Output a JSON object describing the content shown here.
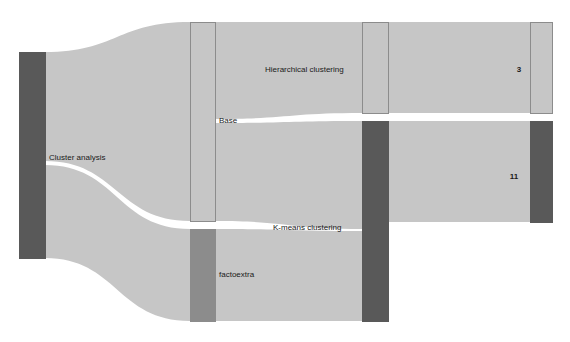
{
  "chart_data": {
    "type": "sankey",
    "title": "",
    "background_color": "#ffffff",
    "link_color": "#c6c6c6",
    "link_opacity": 1,
    "nodes": [
      {
        "id": "cluster-analysis",
        "label": "Cluster analysis",
        "value": 14,
        "column": 0,
        "x": 19,
        "y": 52,
        "width": 26,
        "height": 206,
        "color": "#595959",
        "stroke": "#595959",
        "label_x": 49,
        "label_y": 158,
        "label_anchor": "start"
      },
      {
        "id": "base",
        "label": "Base",
        "value": 9,
        "column": 1,
        "x": 190,
        "y": 22,
        "width": 25,
        "height": 199,
        "color": "#c6c6c6",
        "stroke": "#8c8c8c",
        "label_x": 219,
        "label_y": 121,
        "label_anchor": "start"
      },
      {
        "id": "factoextra",
        "label": "factoextra",
        "value": 5,
        "column": 1,
        "x": 190,
        "y": 229,
        "width": 25,
        "height": 92,
        "color": "#8c8c8c",
        "stroke": "#8c8c8c",
        "label_x": 219,
        "label_y": 275,
        "label_anchor": "start"
      },
      {
        "id": "hierarchical-clustering",
        "label": "Hierarchical clustering",
        "value": 3,
        "column": 2,
        "x": 362,
        "y": 22,
        "width": 26,
        "height": 91,
        "color": "#c6c6c6",
        "stroke": "#8c8c8c",
        "label_x": 265,
        "label_y": 70,
        "label_anchor": "start"
      },
      {
        "id": "k-means-clustering",
        "label": "K-means clustering",
        "value": 11,
        "column": 2,
        "x": 362,
        "y": 121,
        "width": 26,
        "height": 200,
        "color": "#595959",
        "stroke": "#595959",
        "label_x": 273,
        "label_y": 228,
        "label_anchor": "start"
      },
      {
        "id": "out-3",
        "label": "3",
        "value": 3,
        "column": 3,
        "x": 530,
        "y": 22,
        "width": 22,
        "height": 91,
        "color": "#c6c6c6",
        "stroke": "#8c8c8c",
        "label_x": 519,
        "label_y": 70,
        "label_anchor": "middle"
      },
      {
        "id": "out-11",
        "label": "11",
        "value": 11,
        "column": 3,
        "x": 530,
        "y": 121,
        "width": 22,
        "height": 101,
        "color": "#595959",
        "stroke": "#595959",
        "label_x": 514,
        "label_y": 177,
        "label_anchor": "middle"
      }
    ],
    "links": [
      {
        "id": "link-cluster-base",
        "source": "cluster-analysis",
        "target": "base",
        "value": 9,
        "path": "M45,52 C117,52 117,22 190,22 L190,221 C117,221 117,161 45,161 Z"
      },
      {
        "id": "link-cluster-factoextra",
        "source": "cluster-analysis",
        "target": "factoextra",
        "value": 5,
        "path": "M45,165 C117,165 117,229 190,229 L190,321 C117,321 117,258 45,258 Z"
      },
      {
        "id": "link-base-hierarchical",
        "source": "base",
        "target": "hierarchical-clustering",
        "value": 3,
        "path": "M215,22 C288,22 288,22 362,22 L362,113 C288,113 288,119 215,119 Z"
      },
      {
        "id": "link-base-kmeans",
        "source": "base",
        "target": "k-means-clustering",
        "value": 6,
        "path": "M215,123 C288,123 288,121 362,121 L362,229 C288,229 288,221 215,221 Z"
      },
      {
        "id": "link-factoextra-kmeans",
        "source": "factoextra",
        "target": "k-means-clustering",
        "value": 5,
        "path": "M215,229 C288,229 288,231 362,231 L362,321 C288,321 288,321 215,321 Z"
      },
      {
        "id": "link-hierarchical-out3",
        "source": "hierarchical-clustering",
        "target": "out-3",
        "value": 3,
        "path": "M388,22 C459,22 459,22 530,22 L530,113 C459,113 459,113 388,113 Z"
      },
      {
        "id": "link-kmeans-out11",
        "source": "k-means-clustering",
        "target": "out-11",
        "value": 11,
        "path": "M388,121 C459,121 459,121 530,121 L530,222 C459,222 459,222 388,222 Z"
      }
    ]
  }
}
